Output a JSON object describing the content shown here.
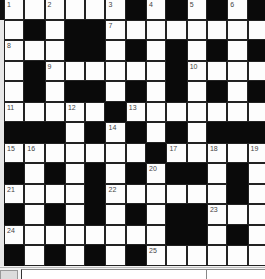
{
  "puzzle": {
    "rows": 13,
    "cols": 13,
    "layout": [
      "WWWWWWBWBWBWB",
      "WBWBBWWWWWWWW",
      "WWWBBWBWBWBWB",
      "WBWWWWWWBWWWW",
      "WBWBBWBWBWBWB",
      "WWWWWBWWWWWWW",
      "BBBWBWBWBWBBB",
      "WWWWWWWBWWWWW",
      "BWBWBWBWBBWBW",
      "WWWWBWWWWWWBW",
      "BWBWBWBWBBWWW",
      "WWWWWWWWBBWBW",
      "BWBWBWBWWWWWW"
    ],
    "numbers": [
      {
        "row": 0,
        "col": 0,
        "n": "1"
      },
      {
        "row": 0,
        "col": 2,
        "n": "2"
      },
      {
        "row": 0,
        "col": 5,
        "n": "3"
      },
      {
        "row": 0,
        "col": 7,
        "n": "4"
      },
      {
        "row": 0,
        "col": 9,
        "n": "5"
      },
      {
        "row": 0,
        "col": 11,
        "n": "6"
      },
      {
        "row": 1,
        "col": 5,
        "n": "7"
      },
      {
        "row": 2,
        "col": 0,
        "n": "8"
      },
      {
        "row": 3,
        "col": 2,
        "n": "9"
      },
      {
        "row": 3,
        "col": 9,
        "n": "10"
      },
      {
        "row": 5,
        "col": 0,
        "n": "11"
      },
      {
        "row": 5,
        "col": 3,
        "n": "12"
      },
      {
        "row": 5,
        "col": 6,
        "n": "13"
      },
      {
        "row": 6,
        "col": 5,
        "n": "14"
      },
      {
        "row": 7,
        "col": 0,
        "n": "15"
      },
      {
        "row": 7,
        "col": 1,
        "n": "16"
      },
      {
        "row": 7,
        "col": 8,
        "n": "17"
      },
      {
        "row": 7,
        "col": 10,
        "n": "18"
      },
      {
        "row": 7,
        "col": 12,
        "n": "19"
      },
      {
        "row": 8,
        "col": 7,
        "n": "20"
      },
      {
        "row": 9,
        "col": 0,
        "n": "21"
      },
      {
        "row": 9,
        "col": 5,
        "n": "22"
      },
      {
        "row": 10,
        "col": 10,
        "n": "23"
      },
      {
        "row": 11,
        "col": 0,
        "n": "24"
      },
      {
        "row": 12,
        "col": 7,
        "n": "25"
      }
    ],
    "colors": {
      "block": "#0a0a0a",
      "cell": "#fdfdfd",
      "number": "#444444"
    }
  },
  "status_bar": {
    "left_value": "",
    "main_value": "",
    "right_value": ""
  }
}
